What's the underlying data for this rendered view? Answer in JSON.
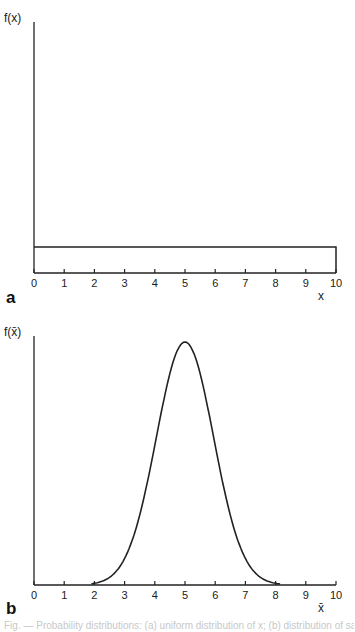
{
  "chart_data": [
    {
      "panel": "a",
      "type": "line",
      "title": "",
      "ylabel": "f(x)",
      "xlabel": "x",
      "xlim": [
        0,
        10
      ],
      "x_ticks": [
        "0",
        "1",
        "2",
        "3",
        "4",
        "5",
        "6",
        "7",
        "8",
        "9",
        "10"
      ],
      "description": "Uniform distribution: constant density over [0, 10]",
      "x": [
        0,
        0,
        10,
        10
      ],
      "y": [
        0,
        0.1,
        0.1,
        0
      ],
      "grid": false
    },
    {
      "panel": "b",
      "type": "line",
      "title": "",
      "ylabel": "f(x̄)",
      "xlabel": "x̄",
      "xlim": [
        0,
        10
      ],
      "x_ticks": [
        "0",
        "1",
        "2",
        "3",
        "4",
        "5",
        "6",
        "7",
        "8",
        "9",
        "10"
      ],
      "description": "Approximately normal sampling distribution of the mean, centered at 5, support roughly 2 to 8",
      "x": [
        2,
        2.5,
        3,
        3.5,
        4,
        4.5,
        5,
        5.5,
        6,
        6.5,
        7,
        7.5,
        8
      ],
      "y": [
        0.0,
        0.03,
        0.12,
        0.3,
        0.6,
        0.9,
        1.0,
        0.9,
        0.6,
        0.3,
        0.12,
        0.03,
        0.0
      ],
      "grid": false
    }
  ],
  "panels": {
    "a": {
      "label": "a",
      "ylabel": "f(x)",
      "xlabel": "x"
    },
    "b": {
      "label": "b",
      "ylabel": "f(x̄)",
      "xlabel": "x̄"
    }
  },
  "ticks": [
    "0",
    "1",
    "2",
    "3",
    "4",
    "5",
    "6",
    "7",
    "8",
    "9",
    "10"
  ],
  "caption": "Fig. — Probability distributions: (a) uniform distribution of x; (b) distribution of sample mean x̄"
}
